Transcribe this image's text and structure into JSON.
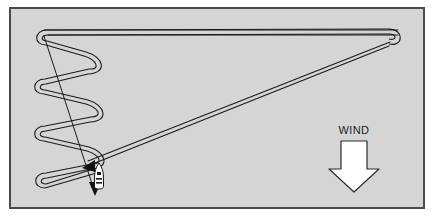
{
  "figure": {
    "kind": "sailing-course-diagram",
    "background_color": "#d5d5d5",
    "frame_color": "#4a4a4a",
    "line_color": "#1a1a1a",
    "arrow_fill": "#ffffff"
  },
  "wind": {
    "label": "WIND",
    "direction": "down",
    "arrow_icon": "down-block-arrow-icon"
  },
  "boat": {
    "icon": "sailboat-icon",
    "x": 99,
    "y": 176
  },
  "course": {
    "description": "Upwind beat sailed as a series of tacks up the left side, a long reach across to the windward mark at right, then a return leg back to the start.",
    "tack_vertices": [
      {
        "label": "tack-1",
        "x": 44,
        "y": 37
      },
      {
        "label": "tack-2",
        "x": 92,
        "y": 62
      },
      {
        "label": "tack-3",
        "x": 42,
        "y": 86
      },
      {
        "label": "tack-4",
        "x": 93,
        "y": 110
      },
      {
        "label": "tack-5",
        "x": 42,
        "y": 133
      },
      {
        "label": "tack-6",
        "x": 94,
        "y": 156
      },
      {
        "label": "tack-7",
        "x": 43,
        "y": 180
      }
    ],
    "windward_mark": {
      "label": "windward-mark",
      "x": 389,
      "y": 38
    },
    "reach_leg": {
      "from_x": 44,
      "from_y": 33,
      "to_x": 389,
      "to_y": 36
    },
    "return_leg": {
      "from_x": 389,
      "from_y": 40,
      "to_x": 99,
      "to_y": 170
    }
  },
  "annotations": {
    "heading_arrow_label": "boat-heading-arrow",
    "course_arrow_label": "course-direction-arrow"
  }
}
